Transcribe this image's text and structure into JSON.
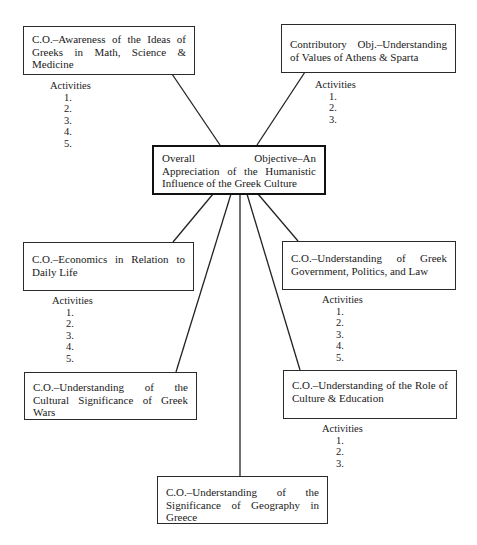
{
  "diagram": {
    "center": {
      "label": "Overall Objective–An Appreciation of the Humanistic Influence of the Greek Culture"
    },
    "objectives": [
      {
        "id": "math-science-medicine",
        "label": "C.O.–Awareness of the Ideas of Greeks in Math, Science & Medicine",
        "activities_header": "Activities",
        "activities": [
          "1.",
          "2.",
          "3.",
          "4.",
          "5."
        ]
      },
      {
        "id": "athens-sparta",
        "label": "Contributory Obj.–Understanding of Values of Athens & Sparta",
        "activities_header": "Activities",
        "activities": [
          "1.",
          "2.",
          "3."
        ]
      },
      {
        "id": "economics",
        "label": "C.O.–Economics in Relation to Daily Life",
        "activities_header": "Activities",
        "activities": [
          "1.",
          "2.",
          "3.",
          "4.",
          "5."
        ]
      },
      {
        "id": "government",
        "label": "C.O.–Understanding of Greek Government, Politics, and Law",
        "activities_header": "Activities",
        "activities": [
          "1.",
          "2.",
          "3.",
          "4.",
          "5."
        ]
      },
      {
        "id": "wars",
        "label": "C.O.–Understanding of the Cultural Significance of Greek Wars"
      },
      {
        "id": "culture-education",
        "label": "C.O.–Understanding of the Role of Culture & Education",
        "activities_header": "Activities",
        "activities": [
          "1.",
          "2.",
          "3."
        ]
      },
      {
        "id": "geography",
        "label": "C.O.–Understanding of the Significance of Geography in Greece"
      }
    ],
    "edges": [
      {
        "from": "math-science-medicine",
        "to": "center"
      },
      {
        "from": "athens-sparta",
        "to": "center"
      },
      {
        "from": "center",
        "to": "economics"
      },
      {
        "from": "center",
        "to": "wars"
      },
      {
        "from": "center",
        "to": "geography"
      },
      {
        "from": "center",
        "to": "culture-education"
      },
      {
        "from": "center",
        "to": "government"
      }
    ]
  }
}
